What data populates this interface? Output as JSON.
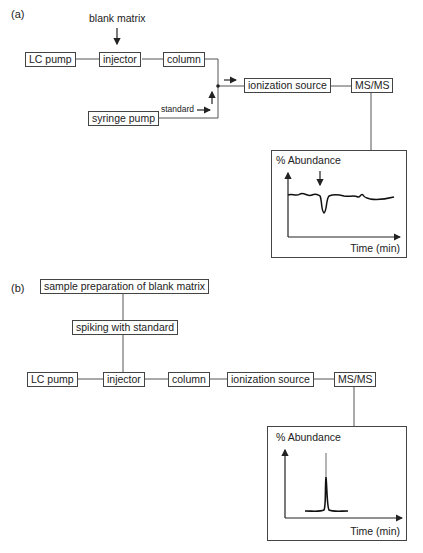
{
  "panel_a": {
    "label": "(a)",
    "blank_matrix": "blank matrix",
    "standard": "standard",
    "boxes": {
      "lc_pump": "LC pump",
      "injector": "injector",
      "column": "column",
      "syringe_pump": "syringe pump",
      "ionization_source": "ionization source",
      "msms": "MS/MS"
    },
    "chart": {
      "ylabel": "% Abundance",
      "xlabel": "Time (min)"
    }
  },
  "panel_b": {
    "label": "(b)",
    "boxes": {
      "sample_prep": "sample preparation of blank matrix",
      "spiking": "spiking with standard",
      "lc_pump": "LC pump",
      "injector": "injector",
      "column": "column",
      "ionization_source": "ionization source",
      "msms": "MS/MS"
    },
    "chart": {
      "ylabel": "% Abundance",
      "xlabel": "Time (min)"
    }
  }
}
